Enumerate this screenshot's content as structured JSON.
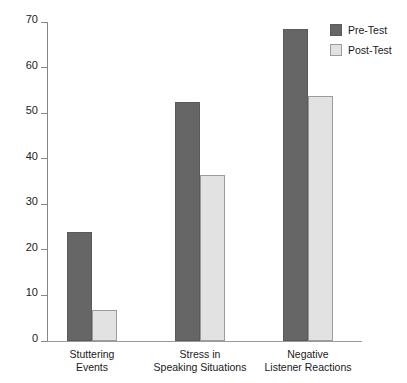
{
  "chart_data": {
    "type": "bar",
    "title": "",
    "xlabel": "",
    "ylabel": "",
    "ylim": [
      0,
      70
    ],
    "ytick_values": [
      0,
      10,
      20,
      30,
      40,
      50,
      60,
      70
    ],
    "ytick_labels": [
      "0",
      "10",
      "20",
      "30",
      "40",
      "50",
      "60",
      "70"
    ],
    "grid": false,
    "legend_position": "top-right",
    "categories": [
      "Stuttering\nEvents",
      "Stress in\nSpeaking Situations",
      "Negative\nListener Reactions"
    ],
    "series": [
      {
        "name": "Pre-Test",
        "color": "#666666",
        "values": [
          24,
          52.5,
          68.5
        ]
      },
      {
        "name": "Post-Test",
        "color": "#e2e2e2",
        "values": [
          6.8,
          36.5,
          53.8
        ]
      }
    ]
  },
  "legend": {
    "items": [
      {
        "label": "Pre-Test",
        "swatch": "pre"
      },
      {
        "label": "Post-Test",
        "swatch": "post"
      }
    ]
  }
}
